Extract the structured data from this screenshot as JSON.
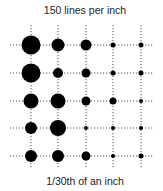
{
  "diagram": {
    "title": "150 lines per inch",
    "caption": "1/30th of an inch",
    "grid": {
      "columns_x": [
        31,
        58,
        86,
        113,
        141
      ],
      "rows_y": [
        45,
        73,
        101,
        128,
        156
      ],
      "h_line_start_x": 10,
      "h_line_end_x": 154,
      "v_line_start_y": 25,
      "v_line_end_y": 168,
      "line_color": "#555555",
      "line_dash": "1.2,1.8"
    },
    "dot_color": "#000000",
    "dot_diameters": [
      [
        19,
        13,
        11,
        5,
        5
      ],
      [
        19,
        10,
        9,
        5,
        5
      ],
      [
        15,
        15,
        9,
        7,
        4
      ],
      [
        12,
        16,
        4,
        4,
        4
      ],
      [
        12,
        12,
        9,
        4,
        5
      ]
    ]
  }
}
